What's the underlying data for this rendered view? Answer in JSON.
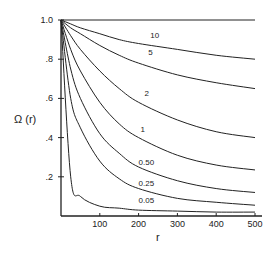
{
  "chart_data": {
    "type": "line",
    "title": "",
    "xlabel": "r",
    "ylabel": "Ω (r)",
    "xlim": [
      0,
      500
    ],
    "ylim": [
      0,
      1.0
    ],
    "grid": false,
    "legend": "inline curve labels",
    "x_ticks": [
      "100",
      "200",
      "300",
      "400",
      "500"
    ],
    "y_ticks": [
      ".2",
      ".4",
      ".6",
      ".8",
      "1.0"
    ],
    "x": [
      0,
      25,
      50,
      100,
      150,
      200,
      300,
      400,
      500
    ],
    "series": [
      {
        "name": "10",
        "values": [
          1.0,
          0.98,
          0.96,
          0.93,
          0.9,
          0.88,
          0.85,
          0.82,
          0.8
        ]
      },
      {
        "name": "5",
        "values": [
          1.0,
          0.96,
          0.93,
          0.87,
          0.82,
          0.78,
          0.72,
          0.68,
          0.65
        ]
      },
      {
        "name": "2",
        "values": [
          1.0,
          0.92,
          0.85,
          0.74,
          0.65,
          0.58,
          0.49,
          0.43,
          0.4
        ]
      },
      {
        "name": "1",
        "values": [
          1.0,
          0.85,
          0.74,
          0.58,
          0.47,
          0.4,
          0.31,
          0.26,
          0.235
        ]
      },
      {
        "name": "0.50",
        "values": [
          1.0,
          0.75,
          0.6,
          0.42,
          0.32,
          0.25,
          0.18,
          0.14,
          0.12
        ]
      },
      {
        "name": "0.25",
        "values": [
          1.0,
          0.6,
          0.45,
          0.28,
          0.19,
          0.14,
          0.09,
          0.07,
          0.055
        ]
      },
      {
        "name": "0.05",
        "values": [
          1.0,
          0.2,
          0.1,
          0.05,
          0.04,
          0.03,
          0.025,
          0.02,
          0.02
        ]
      }
    ],
    "reference_line": {
      "name": "Ω = 1.0",
      "value": 1.0
    },
    "label_positions": [
      {
        "name": "10",
        "r": 230,
        "y": 0.91
      },
      {
        "name": "5",
        "r": 225,
        "y": 0.82
      },
      {
        "name": "2",
        "r": 215,
        "y": 0.61
      },
      {
        "name": "1",
        "r": 205,
        "y": 0.43
      },
      {
        "name": "0.50",
        "r": 200,
        "y": 0.26
      },
      {
        "name": "0.25",
        "r": 200,
        "y": 0.155
      },
      {
        "name": "0.05",
        "r": 200,
        "y": 0.065
      }
    ]
  }
}
